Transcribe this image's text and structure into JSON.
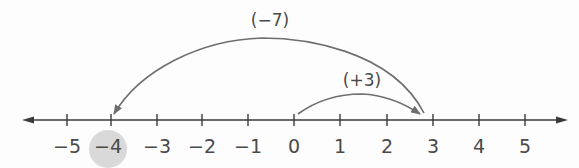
{
  "diagram": {
    "type": "number-line",
    "axis": {
      "min": -5,
      "max": 5,
      "arrows": "both"
    },
    "ticks": [
      {
        "value": -5,
        "label": "−5",
        "x": 67
      },
      {
        "value": -4,
        "label": "−4",
        "x": 111
      },
      {
        "value": -3,
        "label": "−3",
        "x": 157
      },
      {
        "value": -2,
        "label": "−2",
        "x": 202
      },
      {
        "value": -1,
        "label": "−1",
        "x": 248
      },
      {
        "value": 0,
        "label": "0",
        "x": 294
      },
      {
        "value": 1,
        "label": "1",
        "x": 340
      },
      {
        "value": 2,
        "label": "2",
        "x": 387
      },
      {
        "value": 3,
        "label": "3",
        "x": 433
      },
      {
        "value": 4,
        "label": "4",
        "x": 479
      },
      {
        "value": 5,
        "label": "5",
        "x": 525
      }
    ],
    "highlighted_value": -4,
    "jumps": [
      {
        "label": "(+3)",
        "from": 0,
        "to": 3
      },
      {
        "label": "(−7)",
        "from": 3,
        "to": -4
      }
    ],
    "colors": {
      "line": "#3a3a3a",
      "arc": "#6e6e6e",
      "text": "#4a4a4a",
      "highlight": "#d9d9d9"
    }
  }
}
